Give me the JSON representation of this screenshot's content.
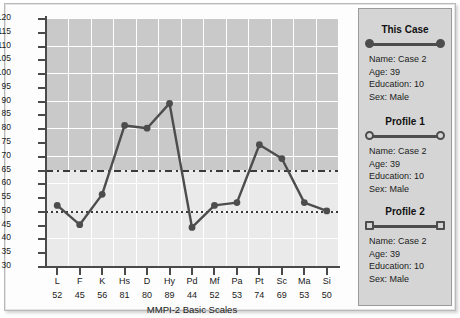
{
  "chart_data": {
    "type": "line",
    "title": "",
    "xlabel": "MMPI-2 Basic Scales",
    "ylabel": "",
    "ylim": [
      30,
      120
    ],
    "ytick_step": 5,
    "grid": true,
    "gridline_step": 10,
    "legend_position": "right",
    "categories": [
      "L",
      "F",
      "K",
      "Hs",
      "D",
      "Hy",
      "Pd",
      "Mf",
      "Pa",
      "Pt",
      "Sc",
      "Ma",
      "Si"
    ],
    "yticks": [
      120,
      115,
      110,
      105,
      100,
      95,
      90,
      85,
      80,
      75,
      70,
      65,
      60,
      55,
      50,
      45,
      40,
      35,
      30
    ],
    "gridlines_y": [
      120,
      110,
      100,
      90,
      80,
      70,
      60,
      50,
      40,
      30
    ],
    "series": [
      {
        "name": "This Case",
        "marker": "filled-circle",
        "color": "#4d4d4d",
        "values": [
          52,
          45,
          56,
          81,
          80,
          89,
          44,
          52,
          53,
          74,
          69,
          53,
          50
        ]
      }
    ],
    "point_labels": [
      "52",
      "45",
      "56",
      "81",
      "80",
      "89",
      "44",
      "52",
      "53",
      "74",
      "69",
      "53",
      "50"
    ],
    "reference_lines": [
      {
        "value": 65,
        "style": "dash-dot",
        "color": "#3a3a3a"
      },
      {
        "value": 50,
        "style": "dotted",
        "color": "#3a3a3a"
      }
    ],
    "shading": {
      "upper_band_color": "#c9c9c9",
      "lower_band_color": "#eaeaea",
      "boundary": 65
    }
  },
  "legend": {
    "entries": [
      {
        "title": "This Case",
        "marker": "filled-circle",
        "fields": [
          "Name: Case 2",
          "Age: 39",
          "Education: 10",
          "Sex: Male"
        ]
      },
      {
        "title": "Profile 1",
        "marker": "hollow-circle",
        "fields": [
          "Name: Case 2",
          "Age: 39",
          "Education: 10",
          "Sex: Male"
        ]
      },
      {
        "title": "Profile 2",
        "marker": "hollow-square",
        "fields": [
          "Name: Case 2",
          "Age: 39",
          "Education: 10",
          "Sex: Male"
        ]
      }
    ]
  },
  "colors": {
    "line": "#4d4d4d",
    "grid": "#ffffff",
    "axis": "#4a4a4a",
    "plot_upper": "#c9c9c9",
    "plot_lower": "#eaeaea",
    "legend_bg": "#d5d5d5"
  }
}
